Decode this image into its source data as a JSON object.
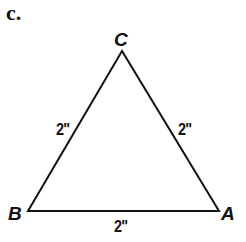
{
  "part_label": "c.",
  "triangle": {
    "vertices": [
      {
        "name": "C",
        "x": 122,
        "y": 51
      },
      {
        "name": "B",
        "x": 28,
        "y": 211
      },
      {
        "name": "A",
        "x": 219,
        "y": 211
      }
    ],
    "sides": [
      {
        "between": "B-C",
        "label": "2\""
      },
      {
        "between": "C-A",
        "label": "2\""
      },
      {
        "between": "B-A",
        "label": "2\""
      }
    ],
    "stroke_color": "#111111"
  },
  "labels": {
    "vertex_c": "C",
    "vertex_b": "B",
    "vertex_a": "A",
    "side_bc": "2\"",
    "side_ca": "2\"",
    "side_ba": "2\""
  }
}
